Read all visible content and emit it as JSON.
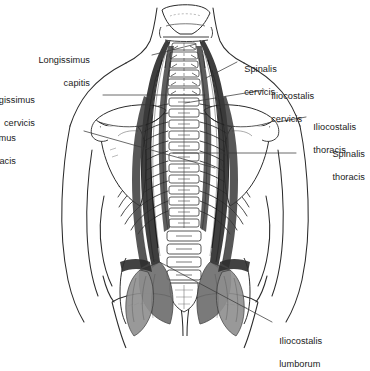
{
  "figure": {
    "view": "posterior",
    "style": "black-and-white anatomical line drawing with gray muscle shading",
    "colors": {
      "background": "#ffffff",
      "ink": "#1a1a1a",
      "outline": "#2b2b2b",
      "muscle_dark": "#2e2e2e",
      "muscle_mid": "#6f6f6f",
      "muscle_light": "#9a9a9a",
      "bone_fill": "#ffffff",
      "leader_line": "#3a3a3a"
    }
  },
  "labels": [
    {
      "id": "longissimus-capitis",
      "text": "Longissimus\ncapitis",
      "align": "right",
      "x": 88,
      "y": 44
    },
    {
      "id": "longissimus-cervicis",
      "text": "Longissimus\ncervicis",
      "align": "right",
      "x": 33,
      "y": 84
    },
    {
      "id": "longissimus-thoracis",
      "text": "Longissimus\nthoracis",
      "align": "right",
      "x": 14,
      "y": 122
    },
    {
      "id": "spinalis-cervicis",
      "text": "Spinalis\ncervicis",
      "align": "left",
      "x": 239,
      "y": 53
    },
    {
      "id": "iliocostalis-cervicis",
      "text": "Iliocostalis\ncervicis",
      "align": "left",
      "x": 266,
      "y": 80
    },
    {
      "id": "iliocostalis-thoracis",
      "text": "Iliocostalis\nthoracis",
      "align": "left",
      "x": 308,
      "y": 111
    },
    {
      "id": "spinalis-thoracis",
      "text": "Spinalis\nthoracis",
      "align": "right",
      "x": 297,
      "y": 138
    },
    {
      "id": "iliocostalis-lumborum",
      "text": "Iliocostalis\nlumborum",
      "align": "left",
      "x": 274,
      "y": 325
    }
  ],
  "label_text": {
    "longissimus_capitis_line1": "Longissimus",
    "longissimus_capitis_line2": "capitis",
    "longissimus_cervicis_line1": "Longissimus",
    "longissimus_cervicis_line2": "cervicis",
    "longissimus_thoracis_line1": "Longissimus",
    "longissimus_thoracis_line2": "thoracis",
    "spinalis_cervicis_line1": "Spinalis",
    "spinalis_cervicis_line2": "cervicis",
    "iliocostalis_cervicis_line1": "Iliocostalis",
    "iliocostalis_cervicis_line2": "cervicis",
    "iliocostalis_thoracis_line1": "Iliocostalis",
    "iliocostalis_thoracis_line2": "thoracis",
    "spinalis_thoracis_line1": "Spinalis",
    "spinalis_thoracis_line2": "thoracis",
    "iliocostalis_lumborum_line1": "Iliocostalis",
    "iliocostalis_lumborum_line2": "lumborum"
  },
  "anatomy_parts": [
    "skull-base",
    "cervical-vertebrae",
    "thoracic-vertebrae",
    "lumbar-vertebrae",
    "sacrum",
    "ribs-left",
    "ribs-right",
    "scapula-left",
    "scapula-right",
    "torso-outline",
    "arm-outline-left",
    "arm-outline-right",
    "pelvis-outline",
    "erector-spinae-left",
    "erector-spinae-right"
  ]
}
